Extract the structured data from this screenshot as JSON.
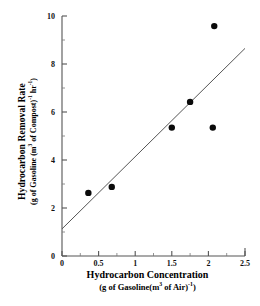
{
  "chart_data": {
    "type": "scatter",
    "title": "",
    "xlabel": "Hydrocarbon Concentration",
    "xlabel_units": "(g of Gasoline(m3 of Air)-1)",
    "ylabel": "Hydrocarbon Removal Rate",
    "ylabel_units": "(g of Gasoline (m3 of Compost)-1 hr-1)",
    "xlim": [
      0,
      2.5
    ],
    "ylim": [
      0,
      10
    ],
    "xticks": [
      "0",
      "0.5",
      "1",
      "1.5",
      "2",
      "2.5"
    ],
    "xtick_values": [
      0,
      0.5,
      1,
      1.5,
      2,
      2.5
    ],
    "xminor_values": [
      0.25,
      0.75,
      1.25,
      1.75,
      2.25
    ],
    "yticks": [
      "0",
      "2",
      "4",
      "6",
      "8",
      "10"
    ],
    "ytick_values": [
      0,
      2,
      4,
      6,
      8,
      10
    ],
    "yminor_values": [
      1,
      3,
      5,
      7,
      9
    ],
    "grid": false,
    "legend": false,
    "series": [
      {
        "name": "Observed removal rate",
        "marker": "filled-circle",
        "color": "#0a0a0a",
        "points": [
          {
            "x": 0.36,
            "y": 2.63
          },
          {
            "x": 0.68,
            "y": 2.88
          },
          {
            "x": 1.5,
            "y": 5.35
          },
          {
            "x": 1.75,
            "y": 6.42
          },
          {
            "x": 2.08,
            "y": 9.58
          },
          {
            "x": 2.06,
            "y": 5.35
          }
        ]
      }
    ],
    "fit_line": {
      "name": "Linear regression line",
      "color": "#555555",
      "x_start": 0,
      "y_start": 1.13,
      "x_end": 2.5,
      "y_end": 8.65
    }
  },
  "axis_labels": {
    "x_main": "Hydrocarbon Concentration",
    "x_sub_pre": "(g of Gasoline(m",
    "x_sub_sup1": "3",
    "x_sub_mid": " of Air)",
    "x_sub_sup2": "-1",
    "x_sub_post": ")",
    "y_main": "Hydrocarbon Removal Rate",
    "y_sub_pre": "(g of Gasoline (m",
    "y_sub_sup1": "3",
    "y_sub_mid": " of Compost)",
    "y_sub_sup2": "-1",
    "y_sub_mid2": " hr",
    "y_sub_sup3": "-1",
    "y_sub_post": ")"
  }
}
